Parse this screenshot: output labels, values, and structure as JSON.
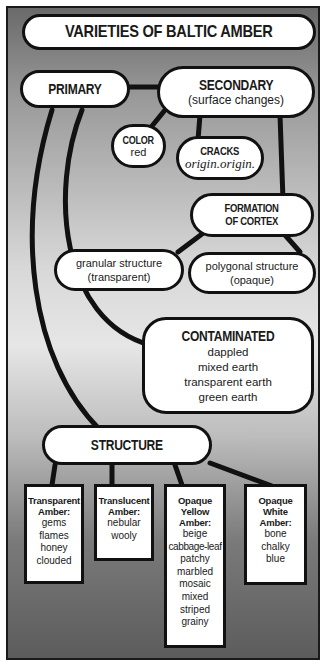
{
  "diagram": {
    "title": "VARIETIES OF BALTIC AMBER",
    "primary": {
      "label": "PRIMARY"
    },
    "secondary": {
      "label": "SECONDARY",
      "sublabel": "(surface changes)"
    },
    "color": {
      "label": "COLOR",
      "sublabel": "red"
    },
    "cracks": {
      "label": "CRACKS",
      "sublabel": "origin.origin."
    },
    "cortex": {
      "label_line1": "FORMATION",
      "label_line2": "OF CORTEX"
    },
    "granular": {
      "line1": "granular structure",
      "line2": "(transparent)"
    },
    "polygonal": {
      "line1": "polygonal structure",
      "line2": "(opaque)"
    },
    "contaminated": {
      "label": "CONTAMINATED",
      "items": [
        "dappled",
        "mixed earth",
        "transparent earth",
        "green earth"
      ]
    },
    "structure": {
      "label": "STRUCTURE"
    },
    "boxes": [
      {
        "title_lines": [
          "Transparent",
          "Amber:"
        ],
        "items": [
          "gems",
          "flames",
          "honey",
          "clouded"
        ]
      },
      {
        "title_lines": [
          "Translucent",
          "Amber:"
        ],
        "items": [
          "nebular",
          "wooly"
        ]
      },
      {
        "title_lines": [
          "Opaque",
          "Yellow",
          "Amber:"
        ],
        "items": [
          "beige",
          "cabbage-leaf",
          "patchy",
          "marbled",
          "mosaic",
          "mixed",
          "striped",
          "grainy"
        ]
      },
      {
        "title_lines": [
          "Opaque",
          "White",
          "Amber:"
        ],
        "items": [
          "bone",
          "chalky",
          "blue"
        ]
      }
    ]
  },
  "colors": {
    "line": "#111111",
    "node_fill": "#ffffff",
    "background_dark": "#5c5c5c",
    "background_light": "#e6e6e6"
  }
}
